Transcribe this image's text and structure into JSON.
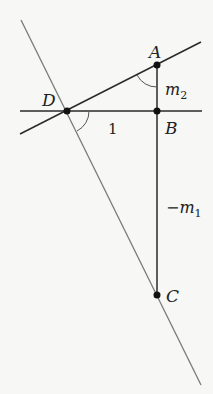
{
  "diagram": {
    "points": {
      "A": {
        "label": "A",
        "x": 157,
        "y": 65
      },
      "B": {
        "label": "B",
        "x": 157,
        "y": 111
      },
      "C": {
        "label": "C",
        "x": 157,
        "y": 295
      },
      "D": {
        "label": "D",
        "x": 67,
        "y": 111
      }
    },
    "segment_labels": {
      "DB": "1",
      "AB_main": "m",
      "AB_sub": "2",
      "BC_main": "−m",
      "BC_sub": "1"
    },
    "colors": {
      "line_dark": "#2a2a2a",
      "line_gray": "#7a7a7a",
      "background": "#f7f7f6"
    }
  }
}
